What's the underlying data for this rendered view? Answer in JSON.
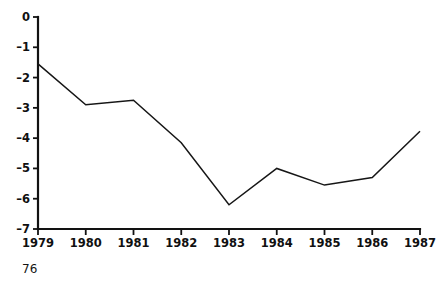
{
  "page": {
    "page_number": "76",
    "background_color": "#ffffff",
    "ink_color": "#121212"
  },
  "chart_data": {
    "type": "line",
    "title": "",
    "subtitle": "",
    "xlabel": "",
    "ylabel": "",
    "categories": [
      "1979",
      "1980",
      "1981",
      "1982",
      "1983",
      "1984",
      "1985",
      "1986",
      "1987"
    ],
    "x": [
      1979,
      1980,
      1981,
      1982,
      1983,
      1984,
      1985,
      1986,
      1987
    ],
    "values": [
      -1.55,
      -2.9,
      -2.75,
      -4.15,
      -6.2,
      -5.0,
      -5.55,
      -5.3,
      -3.77
    ],
    "series": [
      {
        "name": "series-1",
        "values": [
          -1.55,
          -2.9,
          -2.75,
          -4.15,
          -6.2,
          -5.0,
          -5.55,
          -5.3,
          -3.77
        ],
        "color": "#161616"
      }
    ],
    "xlim": [
      1979,
      1987
    ],
    "ylim": [
      -7,
      0
    ],
    "ytick_labels": [
      "0",
      "-1",
      "-2",
      "-3",
      "-4",
      "-5",
      "-6",
      "-7"
    ],
    "ytick_values": [
      0,
      -1,
      -2,
      -3,
      -4,
      -5,
      -6,
      -7
    ],
    "xtick_labels": [
      "1979",
      "1980",
      "1981",
      "1982",
      "1983",
      "1984",
      "1985",
      "1986",
      "1987"
    ],
    "grid": false,
    "legend": null,
    "legend_position": "none",
    "annotations": []
  }
}
